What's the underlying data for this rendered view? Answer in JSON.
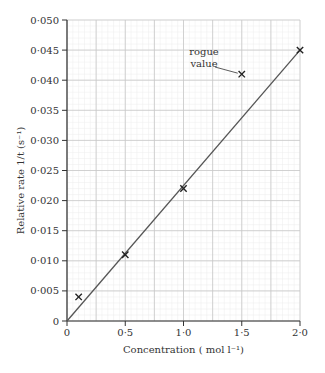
{
  "chart_data": {
    "type": "scatter",
    "title": "",
    "xlabel": "Concentration ( mol l⁻¹)",
    "ylabel": "Relative rate 1/t (s⁻¹)",
    "xlim": [
      0,
      2.0
    ],
    "ylim": [
      0,
      0.05
    ],
    "x_ticks": [
      0,
      0.5,
      1.0,
      1.5,
      2.0
    ],
    "x_tick_labels": [
      "0",
      "0·5",
      "1·0",
      "1·5",
      "2·0"
    ],
    "y_ticks": [
      0,
      0.005,
      0.01,
      0.015,
      0.02,
      0.025,
      0.03,
      0.035,
      0.04,
      0.045,
      0.05
    ],
    "y_tick_labels": [
      "0",
      "0·005",
      "0·010",
      "0·015",
      "0·020",
      "0·025",
      "0·030",
      "0·035",
      "0·040",
      "0·045",
      "0·050"
    ],
    "grid": true,
    "grid_major_x": 0.25,
    "grid_major_y": 0.005,
    "grid_minor_x": 0.05,
    "grid_minor_y": 0.001,
    "series": [
      {
        "name": "measurements",
        "marker": "x",
        "points": [
          {
            "x": 0.1,
            "y": 0.004
          },
          {
            "x": 0.5,
            "y": 0.011
          },
          {
            "x": 1.0,
            "y": 0.022
          },
          {
            "x": 1.5,
            "y": 0.041
          },
          {
            "x": 2.0,
            "y": 0.045
          }
        ]
      }
    ],
    "best_fit_line": {
      "x": [
        0,
        2.0
      ],
      "y": [
        0,
        0.045
      ]
    },
    "annotations": [
      {
        "text_lines": [
          "rogue",
          "value"
        ],
        "points_to": {
          "x": 1.5,
          "y": 0.041
        }
      }
    ],
    "colors": {
      "axis": "#333333",
      "major_grid": "#c8c8c8",
      "minor_grid": "#ececec",
      "line": "#555555",
      "marker": "#222222"
    }
  }
}
